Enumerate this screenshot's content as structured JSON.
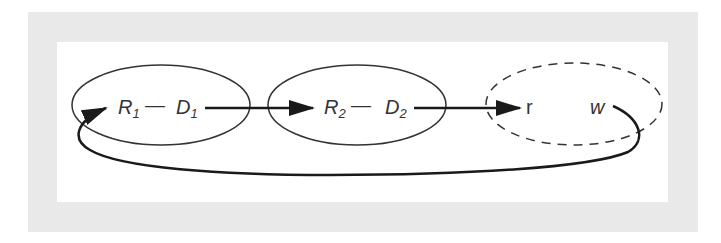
{
  "diagram": {
    "type": "cycle-flow",
    "nodes": [
      {
        "id": "group1",
        "shape": "ellipse",
        "border": "solid",
        "label_left": "R",
        "sub_left": "1",
        "connector": "—",
        "label_right": "D",
        "sub_right": "1"
      },
      {
        "id": "group2",
        "shape": "ellipse",
        "border": "solid",
        "label_left": "R",
        "sub_left": "2",
        "connector": "—",
        "label_right": "D",
        "sub_right": "2"
      },
      {
        "id": "group3",
        "shape": "ellipse",
        "border": "dashed",
        "label_left": "r",
        "label_right": "w"
      }
    ],
    "edges": [
      {
        "from": "D1",
        "to": "R2",
        "style": "solid-arrow"
      },
      {
        "from": "D2",
        "to": "r",
        "style": "solid-arrow"
      },
      {
        "from": "w",
        "to": "R1",
        "style": "curved-feedback-arrow"
      }
    ],
    "colors": {
      "frame": "#e9e9e9",
      "background": "#ffffff",
      "stroke": "#222222",
      "text": "#333333"
    }
  }
}
